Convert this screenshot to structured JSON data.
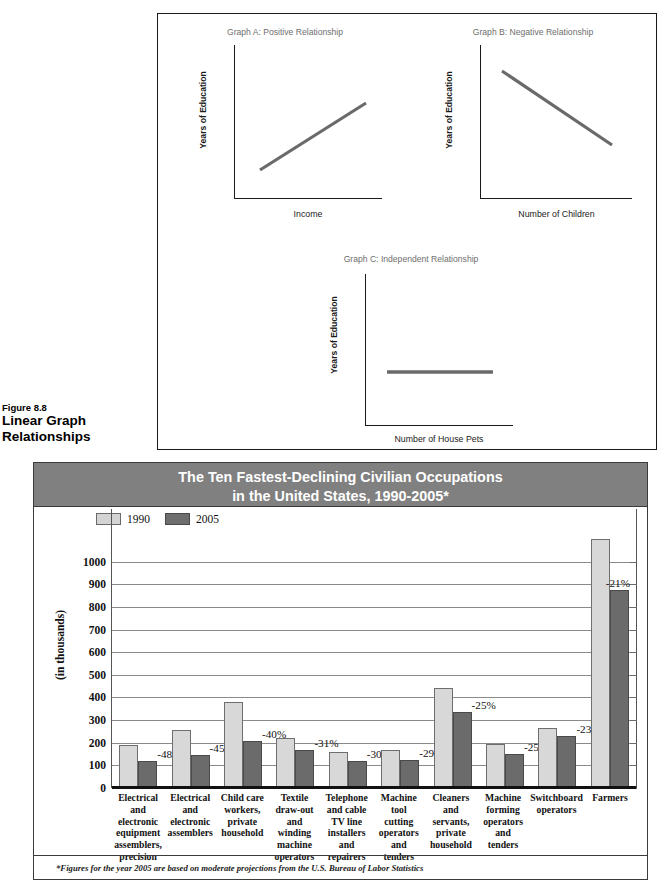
{
  "figure": {
    "number": "Figure 8.8",
    "title_line1": "Linear Graph",
    "title_line2": "Relationships",
    "graphs": [
      {
        "id": "a",
        "title": "Graph A: Positive Relationship",
        "ylabel": "Years of Education",
        "xlabel": "Income",
        "relationship": "positive"
      },
      {
        "id": "b",
        "title": "Graph B: Negative Relationship",
        "ylabel": "Years of Education",
        "xlabel": "Number of Children",
        "relationship": "negative"
      },
      {
        "id": "c",
        "title": "Graph C: Independent Relationship",
        "ylabel": "Years of Education",
        "xlabel": "Number of House Pets",
        "relationship": "independent"
      }
    ]
  },
  "chart_panel": {
    "title_line1": "The Ten Fastest-Declining Civilian Occupations",
    "title_line2": "in the United States, 1990-2005*",
    "footnote": "*Figures for the year 2005 are based on moderate projections from the U.S. Bureau of Labor Statistics",
    "header_bg": "#808080",
    "header_text_color": "#ffffff"
  },
  "chart_data": {
    "type": "bar",
    "title": "The Ten Fastest-Declining Civilian Occupations in the United States, 1990-2005*",
    "xlabel": "",
    "ylabel": "(in thousands)",
    "ylim": [
      0,
      1100
    ],
    "ytick_step": 100,
    "yticks": [
      0,
      100,
      200,
      300,
      400,
      500,
      600,
      700,
      800,
      900,
      1000
    ],
    "ytick_labels": [
      "0",
      "100",
      "200",
      "300",
      "400",
      "500",
      "600",
      "700",
      "800",
      "900",
      "1000"
    ],
    "grid": true,
    "legend_position": "top-left",
    "legend": [
      "1990",
      "2005"
    ],
    "colors": {
      "1990": "#d8d8d8",
      "2005": "#6b6b6b"
    },
    "categories": [
      "Electrical and electronic equipment assemblers, precision",
      "Electrical and electronic assemblers",
      "Child care workers, private household",
      "Textile draw-out and winding machine operators",
      "Telephone and cable TV line installers and repairers",
      "Machine tool cutting operators and tenders",
      "Cleaners and servants, private household",
      "Machine forming operators and tenders",
      "Switchboard operators",
      "Farmers"
    ],
    "category_lines": [
      [
        "Electrical",
        "and",
        "electronic",
        "equipment",
        "assemblers,",
        "precision"
      ],
      [
        "Electrical",
        "and",
        "electronic",
        "assemblers"
      ],
      [
        "Child care",
        "workers,",
        "private",
        "household"
      ],
      [
        "Textile",
        "draw-out",
        "and winding",
        "machine",
        "operators"
      ],
      [
        "Telephone",
        "and cable",
        "TV line",
        "installers",
        "and",
        "repairers"
      ],
      [
        "Machine",
        "tool",
        "cutting",
        "operators",
        "and",
        "tenders"
      ],
      [
        "Cleaners",
        "and",
        "servants,",
        "private",
        "household"
      ],
      [
        "Machine",
        "forming",
        "operators",
        "and",
        "tenders"
      ],
      [
        "Switchboard",
        "operators"
      ],
      [
        "Farmers"
      ]
    ],
    "series": [
      {
        "name": "1990",
        "values": [
          190,
          255,
          380,
          222,
          158,
          168,
          440,
          195,
          265,
          1100
        ]
      },
      {
        "name": "2005",
        "values": [
          118,
          145,
          207,
          168,
          120,
          122,
          335,
          152,
          228,
          875
        ]
      }
    ],
    "change_labels": [
      "-48%",
      "-45%",
      "-40%",
      "-31%",
      "-30%",
      "-29%",
      "-25%",
      "-25%",
      "-23%",
      "-21%"
    ]
  }
}
